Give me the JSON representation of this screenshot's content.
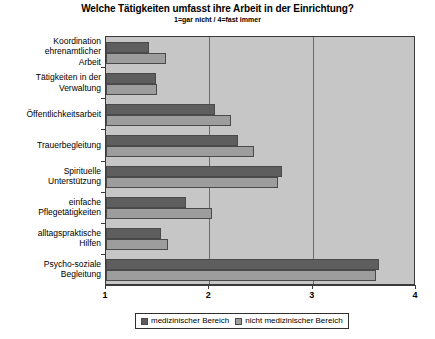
{
  "chart_data": {
    "type": "bar",
    "orientation": "horizontal",
    "title": "Welche Tätigkeiten umfasst ihre Arbeit in der Einrichtung?",
    "subtitle": "1=gar nicht / 4=fast immer",
    "xlabel": "",
    "ylabel": "",
    "xlim": [
      1,
      4
    ],
    "xticks": [
      "1",
      "2",
      "3",
      "4"
    ],
    "grid": "vertical",
    "legend_position": "bottom",
    "categories": [
      "Koordination ehrenamtlicher Arbeit",
      "Tätigkeiten in der Verwaltung",
      "Öffentlichkeitsarbeit",
      "Trauerbegleitung",
      "Spirituelle Unterstützung",
      "einfache Pflegetätigkeiten",
      "alltagspraktische Hilfen",
      "Psycho-soziale Begleitung"
    ],
    "category_lines": [
      [
        "Koordination",
        "ehrenamtlicher",
        "Arbeit"
      ],
      [
        "Tätigkeiten in der",
        "Verwaltung"
      ],
      [
        "Öffentlichkeitsarbeit"
      ],
      [
        "Trauerbegleitung"
      ],
      [
        "Spirituelle",
        "Unterstützung"
      ],
      [
        "einfache",
        "Pflegetätigkeiten"
      ],
      [
        "alltagspraktische",
        "Hilfen"
      ],
      [
        "Psycho-soziale",
        "Begleitung"
      ]
    ],
    "series": [
      {
        "name": "medizinischer Bereich",
        "color": "#5e5e5e",
        "values": [
          1.42,
          1.48,
          2.05,
          2.28,
          2.7,
          1.77,
          1.53,
          3.64
        ]
      },
      {
        "name": "nicht medizinischer Bereich",
        "color": "#9d9d9d",
        "values": [
          1.58,
          1.49,
          2.21,
          2.43,
          2.66,
          2.03,
          1.6,
          3.61
        ]
      }
    ]
  },
  "legend": {
    "entries": [
      {
        "label": "medizinischer Bereich"
      },
      {
        "label": "nicht medizinischer Bereich"
      }
    ]
  }
}
